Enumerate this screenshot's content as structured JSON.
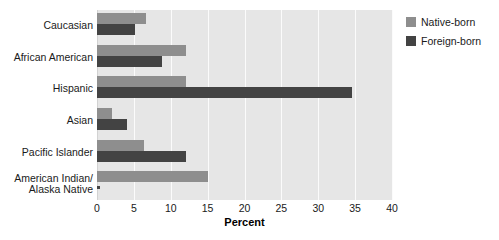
{
  "chart_data": {
    "type": "bar",
    "orientation": "horizontal",
    "title": "",
    "xlabel": "Percent",
    "ylabel": "",
    "xlim": [
      0,
      40
    ],
    "xticks": [
      0,
      5,
      10,
      15,
      20,
      25,
      30,
      35,
      40
    ],
    "grid": true,
    "legend_position": "right",
    "categories": [
      "Caucasian",
      "African American",
      "Hispanic",
      "Asian",
      "Pacific Islander",
      "American Indian/\nAlaska Native"
    ],
    "series": [
      {
        "name": "Native-born",
        "color": "#8e8e8e",
        "values": [
          6.7,
          12.0,
          12.0,
          2.0,
          6.4,
          15.0
        ]
      },
      {
        "name": "Foreign-born",
        "color": "#434343",
        "values": [
          5.2,
          8.8,
          34.6,
          4.0,
          12.0,
          0.2
        ]
      }
    ],
    "annotations": [
      {
        "category": "American Indian/Alaska Native",
        "series": "Foreign-born",
        "marker": "*",
        "note": "value suppressed / too small to display"
      }
    ]
  },
  "axis": {
    "tick_labels": [
      "0",
      "5",
      "10",
      "15",
      "20",
      "25",
      "30",
      "35",
      "40"
    ],
    "title": "Percent"
  },
  "categories": [
    {
      "line1": "Caucasian",
      "line2": ""
    },
    {
      "line1": "African American",
      "line2": ""
    },
    {
      "line1": "Hispanic",
      "line2": ""
    },
    {
      "line1": "Asian",
      "line2": ""
    },
    {
      "line1": "Pacific Islander",
      "line2": ""
    },
    {
      "line1": "American Indian/",
      "line2": "Alaska Native"
    }
  ],
  "legend": {
    "items": [
      {
        "label": "Native-born",
        "color": "#8e8e8e"
      },
      {
        "label": "Foreign-born",
        "color": "#434343"
      }
    ]
  },
  "colors": {
    "native_born": "#8e8e8e",
    "foreign_born": "#434343",
    "plot_background": "#e6e6e6",
    "gridline": "#fbfbfb",
    "page_background": "#ffffff",
    "text": "#1a1a1a"
  }
}
